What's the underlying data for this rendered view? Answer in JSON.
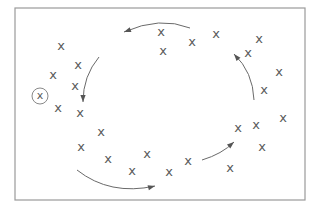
{
  "diagram": {
    "frame": {
      "x": 15,
      "y": 8,
      "width": 290,
      "height": 192,
      "stroke": "#9a9a9a"
    },
    "marker_glyph": "x",
    "marker_color": "#5a5a5a",
    "points": [
      {
        "x": 61,
        "y": 46
      },
      {
        "x": 78,
        "y": 65
      },
      {
        "x": 53,
        "y": 75
      },
      {
        "x": 75,
        "y": 86
      },
      {
        "x": 58,
        "y": 108
      },
      {
        "x": 80,
        "y": 113
      },
      {
        "x": 101,
        "y": 132
      },
      {
        "x": 81,
        "y": 147
      },
      {
        "x": 108,
        "y": 159
      },
      {
        "x": 132,
        "y": 171
      },
      {
        "x": 147,
        "y": 154
      },
      {
        "x": 169,
        "y": 172
      },
      {
        "x": 188,
        "y": 161
      },
      {
        "x": 230,
        "y": 168
      },
      {
        "x": 238,
        "y": 128
      },
      {
        "x": 256,
        "y": 125
      },
      {
        "x": 283,
        "y": 118
      },
      {
        "x": 262,
        "y": 147
      },
      {
        "x": 264,
        "y": 90
      },
      {
        "x": 279,
        "y": 72
      },
      {
        "x": 248,
        "y": 53
      },
      {
        "x": 259,
        "y": 39
      },
      {
        "x": 216,
        "y": 34
      },
      {
        "x": 192,
        "y": 42
      },
      {
        "x": 163,
        "y": 51
      },
      {
        "x": 161,
        "y": 32
      }
    ],
    "outlier": {
      "x": 40,
      "y": 96,
      "r": 8,
      "label": "x"
    },
    "arrows": [
      {
        "name": "arrow-top",
        "path": "M190,28 Q160,16 124,32",
        "tip": [
          124,
          32
        ],
        "angle": 160
      },
      {
        "name": "arrow-left",
        "path": "M99,57 Q83,76 83,102",
        "tip": [
          83,
          102
        ],
        "angle": 90
      },
      {
        "name": "arrow-bottom",
        "path": "M77,170 Q110,196 155,186",
        "tip": [
          155,
          186
        ],
        "angle": -15
      },
      {
        "name": "arrow-lower-right",
        "path": "M202,160 Q222,154 234,142",
        "tip": [
          234,
          142
        ],
        "angle": -40
      },
      {
        "name": "arrow-right",
        "path": "M254,100 Q253,72 234,54",
        "tip": [
          234,
          54
        ],
        "angle": -130
      }
    ]
  }
}
